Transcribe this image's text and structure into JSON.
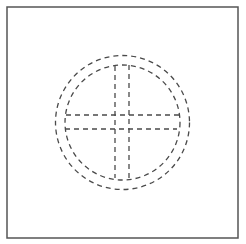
{
  "figure": {
    "colors": {
      "background": "#ffffff",
      "frame": "#555555",
      "dash": "#4a4a4a"
    },
    "frame": {
      "x": 7,
      "y": 7,
      "width": 231,
      "height": 231,
      "stroke_width": 1.5
    },
    "outer_circle": {
      "cx": 122.5,
      "cy": 122.5,
      "r": 67,
      "dash": "5 4"
    },
    "inner_circle": {
      "cx": 122.5,
      "cy": 122.5,
      "r": 57.5,
      "dash": "5 4"
    },
    "horizontal_lines": [
      {
        "x1": 66,
        "y1": 115,
        "x2": 180,
        "y2": 115
      },
      {
        "x1": 65,
        "y1": 129,
        "x2": 177,
        "y2": 129
      }
    ],
    "vertical_lines": [
      {
        "x1": 115,
        "y1": 66,
        "x2": 115,
        "y2": 178
      },
      {
        "x1": 129,
        "y1": 65,
        "x2": 129,
        "y2": 180
      }
    ]
  }
}
